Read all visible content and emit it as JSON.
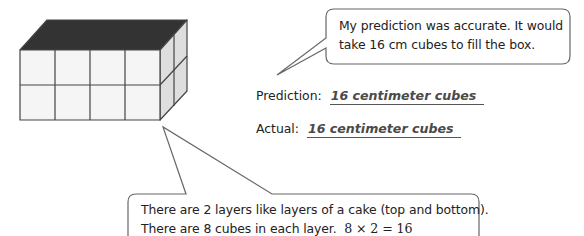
{
  "figure": {
    "type": "rectangular prism of centimeter cubes",
    "front_columns": 4,
    "front_rows": 2,
    "depth_columns": 2,
    "colors": {
      "top_face": "#333333",
      "front_face": "#f4f4f4",
      "side_face": "#dcdcdc",
      "edges": "#444444"
    }
  },
  "callout_top": {
    "lines": [
      "My prediction was accurate.  It would",
      "take 16 cm cubes to fill the box."
    ]
  },
  "results": {
    "prediction_label": "Prediction:",
    "prediction_value": "16 centimeter cubes",
    "actual_label": "Actual:",
    "actual_value": "16 centimeter cubes"
  },
  "callout_bottom": {
    "lines": [
      "There are 2 layers like layers of a cake (top and bottom).",
      "There are 8 cubes in each layer."
    ],
    "equation": "8 × 2 = 16"
  }
}
